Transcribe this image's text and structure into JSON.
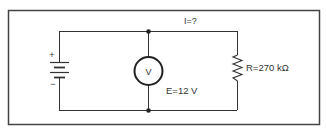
{
  "diagram": {
    "type": "circuit",
    "colors": {
      "wire": "#333333",
      "frame": "#444444",
      "background": "#ffffff"
    },
    "current_label": "I=?",
    "voltmeter_symbol": "V",
    "source_label": "E=12 V",
    "resistor_label": "R=270 kΩ",
    "battery_plus": "+",
    "battery_minus": "−"
  }
}
